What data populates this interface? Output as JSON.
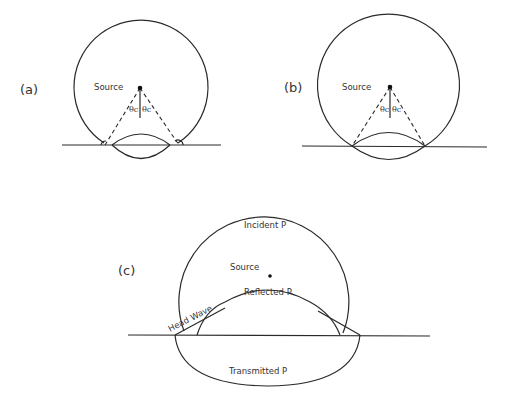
{
  "figure": {
    "panels": [
      {
        "id": "a",
        "label": "(a)",
        "source_label": "Source",
        "angle_left": "θc",
        "angle_right": "θc"
      },
      {
        "id": "b",
        "label": "(b)",
        "source_label": "Source",
        "angle_left": "θc",
        "angle_right": "θc"
      },
      {
        "id": "c",
        "label": "(c)",
        "incident_label": "Incident P",
        "source_label": "Source",
        "reflected_label": "Reflected P",
        "head_wave_label": "Head Wave",
        "transmitted_label": "Transmitted P"
      }
    ]
  },
  "colors": {
    "line": "#2a2a2a",
    "text": "#333333",
    "background": "#ffffff"
  }
}
